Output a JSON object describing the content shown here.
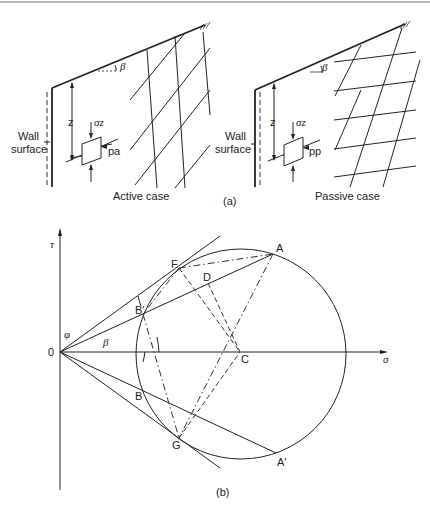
{
  "figure": {
    "panel_a": {
      "label": "(a)",
      "active": {
        "wall_label_line1": "Wall",
        "wall_label_line2": "surface",
        "depth_label": "z",
        "vertical_stress_label": "σz",
        "lateral_pressure_label": "pa",
        "slope_angle_label": "β",
        "case_label": "Active case"
      },
      "passive": {
        "wall_label_line1": "Wall",
        "wall_label_line2": "surface",
        "depth_label": "z",
        "vertical_stress_label": "σz",
        "lateral_pressure_label": "pp",
        "slope_angle_label": "β",
        "case_label": "Passive case"
      }
    },
    "panel_b": {
      "label": "(b)",
      "axes": {
        "x_label": "σ",
        "y_label": "τ",
        "origin_label": "0"
      },
      "angles": {
        "friction_angle": "φ",
        "slope_angle": "β"
      },
      "points": {
        "A": "A",
        "A_prime": "A′",
        "B": "B",
        "B_prime": "B′",
        "C": "C",
        "D": "D",
        "F": "F",
        "G": "G"
      }
    },
    "caption_fragment": ""
  }
}
